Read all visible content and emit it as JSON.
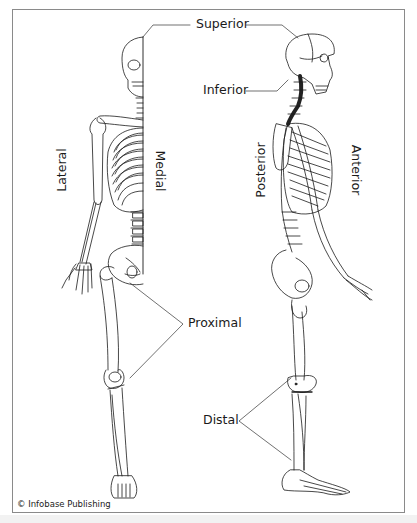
{
  "figure": {
    "labels": {
      "superior": "Superior",
      "inferior": "Inferior",
      "lateral": "Lateral",
      "medial": "Medial",
      "posterior": "Posterior",
      "anterior": "Anterior",
      "proximal": "Proximal",
      "distal": "Distal"
    },
    "credit": "© Infobase Publishing",
    "colors": {
      "line": "#1a1a1a",
      "frame": "#8a8a8a",
      "background": "#ffffff"
    }
  }
}
